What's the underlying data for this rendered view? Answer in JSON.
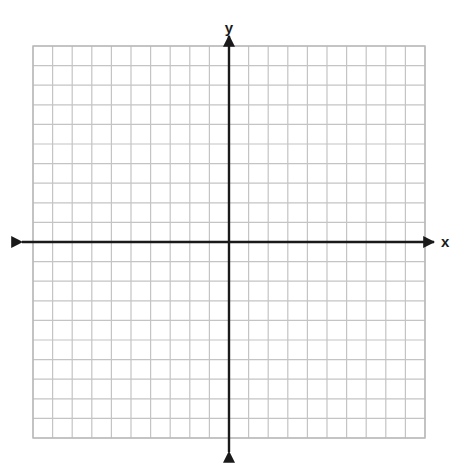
{
  "figure": {
    "kind": "blank-cartesian-coordinate-grid",
    "width": 469,
    "height": 463,
    "background_color": "#ffffff"
  },
  "grid": {
    "columns": 20,
    "rows": 20,
    "cell_size_px": 19.6,
    "left_px": 33,
    "top_px": 46,
    "right_px": 425,
    "bottom_px": 438,
    "line_color": "#c4c4c4",
    "border_color": "#b8b8b8",
    "line_width_px": 1.2
  },
  "axes": {
    "color": "#1a1a1a",
    "line_width_px": 2.4,
    "origin": {
      "x_px": 229,
      "y_px": 242
    },
    "x_axis": {
      "label": "x",
      "label_x_px": 441,
      "label_y_px": 247,
      "start_px": 22,
      "end_px": 434,
      "arrow_start": true,
      "arrow_end": true
    },
    "y_axis": {
      "label": "y",
      "label_x_px": 229,
      "label_y_px": 33,
      "start_px": 36,
      "end_px": 452,
      "arrow_start": true,
      "arrow_end": true
    }
  },
  "chart_data": {
    "type": "scatter",
    "title": "",
    "subtitle": "",
    "xlabel": "x",
    "ylabel": "y",
    "xlim": [
      -10,
      10
    ],
    "ylim": [
      -10,
      10
    ],
    "xticks": [
      -10,
      -9,
      -8,
      -7,
      -6,
      -5,
      -4,
      -3,
      -2,
      -1,
      0,
      1,
      2,
      3,
      4,
      5,
      6,
      7,
      8,
      9,
      10
    ],
    "yticks": [
      -10,
      -9,
      -8,
      -7,
      -6,
      -5,
      -4,
      -3,
      -2,
      -1,
      0,
      1,
      2,
      3,
      4,
      5,
      6,
      7,
      8,
      9,
      10
    ],
    "xtick_labels": [],
    "ytick_labels": [],
    "grid": true,
    "grid_spacing": 1,
    "legend": null,
    "legend_position": "none",
    "annotations": [],
    "series": [],
    "x": [],
    "values": [],
    "note": "Empty graph paper: a blank 20x20 cartesian grid with unlabeled axes, no plotted data points or curves."
  }
}
